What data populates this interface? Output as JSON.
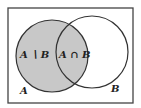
{
  "diagram": {
    "type": "venn",
    "universe_border_color": "#444444",
    "shade_color": "#c8c8c8",
    "circle_stroke": "#333333",
    "labels": {
      "a_minus_b": "A ∖ B",
      "a_intersect_b": "A ∩ B",
      "set_a": "A",
      "set_b": "B"
    },
    "shaded_region": "A"
  }
}
